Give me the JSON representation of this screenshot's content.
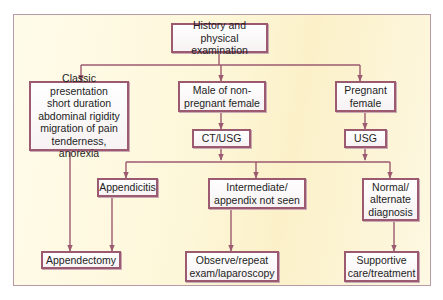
{
  "diagram": {
    "type": "flowchart",
    "colors": {
      "background_panel": "#fdf7d9",
      "panel_border": "#b89aa6",
      "node_border": "#9c5a70",
      "connector": "#9c5a70",
      "text": "#1d1d1d"
    },
    "nodes": {
      "history": {
        "label": "History and physical\nexamination"
      },
      "classic": {
        "label": "Classic presentation\nshort duration\nabdominal rigidity\nmigration of pain\ntenderness, anorexia"
      },
      "male": {
        "label": "Male of non-\npregnant female"
      },
      "pregnant": {
        "label": "Pregnant\nfemale"
      },
      "ctusg": {
        "label": "CT/USG"
      },
      "usg": {
        "label": "USG"
      },
      "appendicitis": {
        "label": "Appendicitis"
      },
      "intermediate": {
        "label": "Intermediate/\nappendix not seen"
      },
      "normal": {
        "label": "Normal/\nalternate\ndiagnosis"
      },
      "appendectomy": {
        "label": "Appendectomy"
      },
      "observe": {
        "label": "Observe/repeat\nexam/laparoscopy"
      },
      "supportive": {
        "label": "Supportive\ncare/treatment"
      }
    },
    "edges": [
      {
        "from": "history",
        "to": "classic"
      },
      {
        "from": "history",
        "to": "male"
      },
      {
        "from": "history",
        "to": "pregnant"
      },
      {
        "from": "classic",
        "to": "appendectomy"
      },
      {
        "from": "male",
        "to": "ctusg"
      },
      {
        "from": "pregnant",
        "to": "usg"
      },
      {
        "from": "ctusg",
        "to": "appendicitis"
      },
      {
        "from": "ctusg",
        "to": "intermediate"
      },
      {
        "from": "ctusg",
        "to": "normal"
      },
      {
        "from": "usg",
        "to": "appendicitis"
      },
      {
        "from": "usg",
        "to": "intermediate"
      },
      {
        "from": "usg",
        "to": "normal"
      },
      {
        "from": "appendicitis",
        "to": "appendectomy"
      },
      {
        "from": "intermediate",
        "to": "observe"
      },
      {
        "from": "normal",
        "to": "supportive"
      }
    ]
  }
}
